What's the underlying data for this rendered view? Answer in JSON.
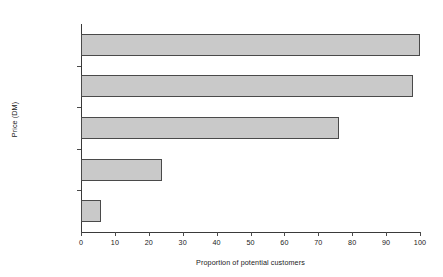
{
  "chart_data": {
    "type": "bar",
    "orientation": "horizontal",
    "title": "",
    "xlabel": "Proportion of potential customers",
    "ylabel": "Price (DM)",
    "categories": [
      "0–2,500",
      "2,000–2,500",
      "2,500–3,000",
      "3,000–3,500",
      "3,500–4,000"
    ],
    "values": [
      100,
      98,
      76,
      24,
      6
    ],
    "xlim": [
      0,
      100
    ],
    "xticks": [
      0,
      10,
      20,
      30,
      40,
      50,
      60,
      70,
      80,
      90,
      100
    ],
    "xtick_labels": [
      "0",
      "10",
      "20",
      "30",
      "40",
      "50",
      "60",
      "70",
      "80",
      "90",
      "100"
    ],
    "grid": false,
    "legend": null,
    "bar_fill_color": "#c9c9c9",
    "bar_border_color": "#4a4a4a",
    "background_color": "#ffffff",
    "axis_color": "#3a3a3a"
  }
}
